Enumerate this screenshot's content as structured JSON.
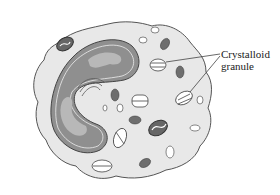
{
  "diagram": {
    "labels": [
      {
        "id": "crystalloid-granule",
        "line1": "Crystalloid",
        "line2": "granule"
      }
    ],
    "colors": {
      "cytoplasm": "#e6e6e6",
      "nucleus_dark": "#8a8a8a",
      "nucleus_light": "#b5b5b5",
      "granule_dark": "#6e6e6e",
      "outline": "#555555"
    }
  }
}
